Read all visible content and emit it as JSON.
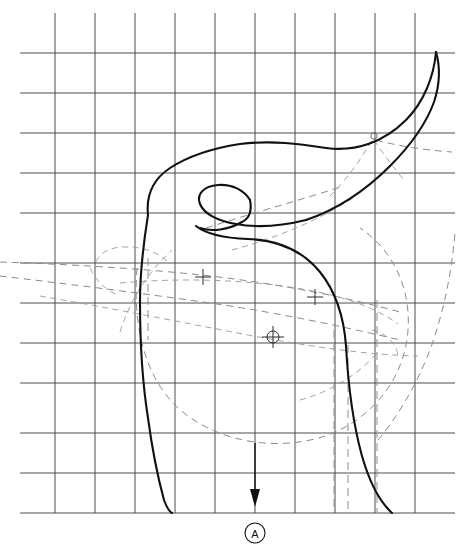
{
  "drawing": {
    "title": "Sectional profile layout drawing",
    "type": "technical-line-drawing",
    "background_color": "#ffffff",
    "canvas": {
      "width": 468,
      "height": 555
    }
  },
  "grid": {
    "label": "Reference grid",
    "line_color": "#3a3a3a",
    "line_width": 0.9,
    "spacing_px": 40,
    "x_positions": [
      55,
      95,
      135,
      175,
      215,
      255,
      295,
      335,
      375,
      415
    ],
    "y_positions": [
      13,
      53,
      93,
      133,
      173,
      213,
      263,
      303,
      343,
      383,
      433,
      473,
      513
    ],
    "extent": {
      "x_min": 20,
      "x_max": 455,
      "y_min": 13,
      "y_max": 513
    }
  },
  "profile": {
    "label": "Main profile outline",
    "stroke_color": "#111111",
    "stroke_width": 2.1,
    "style": "solid",
    "description": "Hooked horn-like upper sweep joined to a broad lower body with tapering sides"
  },
  "construction": {
    "label": "Construction geometry",
    "stroke_color": "#8b8b8b",
    "style": "dashed",
    "dash_pattern": "7 5",
    "elements": [
      "upper-left taper pair",
      "mid-body ellipse band",
      "large lower arc",
      "right-side rising curve",
      "vertical drop lines"
    ]
  },
  "markers": [
    {
      "name": "cross-marker-left",
      "type": "cross",
      "x": 203,
      "y": 277
    },
    {
      "name": "cross-marker-right",
      "type": "cross",
      "x": 315,
      "y": 297
    },
    {
      "name": "circle-crosshair-center",
      "type": "circle-crosshair",
      "x": 273,
      "y": 337,
      "radius": 6
    },
    {
      "name": "small-circle-upper-right",
      "type": "small-circle",
      "x": 374,
      "y": 136,
      "radius": 3
    }
  ],
  "section_marker": {
    "name": "section-a",
    "label": "A",
    "arrow_x": 255,
    "arrow_top_y": 443,
    "arrow_tip_y": 505,
    "circle_center_x": 255,
    "circle_center_y": 533,
    "circle_radius": 10,
    "direction": "down"
  }
}
